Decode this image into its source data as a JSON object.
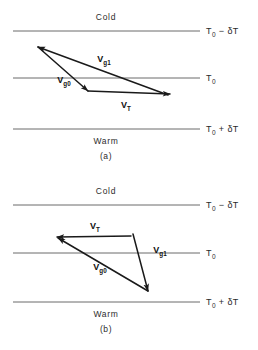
{
  "figure": {
    "background": "#ffffff",
    "line_color": "#595959",
    "vector_color": "#1a1a1a",
    "width": 258,
    "height": 350
  },
  "panels": [
    {
      "id": "a",
      "caption": "(a)",
      "top_region_label": "Cold",
      "bottom_region_label": "Warm",
      "isotherms": [
        {
          "name": "cold-isotherm",
          "label_main": "T",
          "label_sub": "0",
          "label_rest": " − δT",
          "y": 31
        },
        {
          "name": "middle-isotherm",
          "label_main": "T",
          "label_sub": "0",
          "label_rest": "",
          "y": 78
        },
        {
          "name": "warm-isotherm",
          "label_main": "T",
          "label_sub": "0",
          "label_rest": " + δT",
          "y": 129
        }
      ],
      "vectors": [
        {
          "name": "vector-vg1",
          "label_main": "V",
          "label_sub": "g1",
          "x1": 168,
          "y1": 95,
          "x2": 38,
          "y2": 47,
          "label_x": 104,
          "label_y": 62
        },
        {
          "name": "vector-vg0",
          "label_main": "V",
          "label_sub": "g0",
          "x1": 38,
          "y1": 47,
          "x2": 88,
          "y2": 91,
          "label_x": 64,
          "label_y": 83
        },
        {
          "name": "vector-vt",
          "label_main": "V",
          "label_sub": "T",
          "x1": 88,
          "y1": 91,
          "x2": 170,
          "y2": 94,
          "label_x": 126,
          "label_y": 108
        }
      ]
    },
    {
      "id": "b",
      "caption": "(b)",
      "top_region_label": "Cold",
      "bottom_region_label": "Warm",
      "isotherms": [
        {
          "name": "cold-isotherm",
          "label_main": "T",
          "label_sub": "0",
          "label_rest": " − δT",
          "y": 205
        },
        {
          "name": "middle-isotherm",
          "label_main": "T",
          "label_sub": "0",
          "label_rest": "",
          "y": 253
        },
        {
          "name": "warm-isotherm",
          "label_main": "T",
          "label_sub": "0",
          "label_rest": " + δT",
          "y": 302
        }
      ],
      "vectors": [
        {
          "name": "vector-vt",
          "label_main": "V",
          "label_sub": "T",
          "x1": 131,
          "y1": 236,
          "x2": 57,
          "y2": 237,
          "label_x": 95,
          "label_y": 229
        },
        {
          "name": "vector-vg1",
          "label_main": "V",
          "label_sub": "g1",
          "x1": 133,
          "y1": 234,
          "x2": 148,
          "y2": 291,
          "label_x": 160,
          "label_y": 253
        },
        {
          "name": "vector-vg0",
          "label_main": "V",
          "label_sub": "g0",
          "x1": 148,
          "y1": 291,
          "x2": 58,
          "y2": 238,
          "label_x": 100,
          "label_y": 270
        }
      ]
    }
  ],
  "geometry": {
    "isotherm_x_start": 13,
    "isotherm_x_end": 200,
    "temp_label_x": 206,
    "region_label_x": 106
  }
}
